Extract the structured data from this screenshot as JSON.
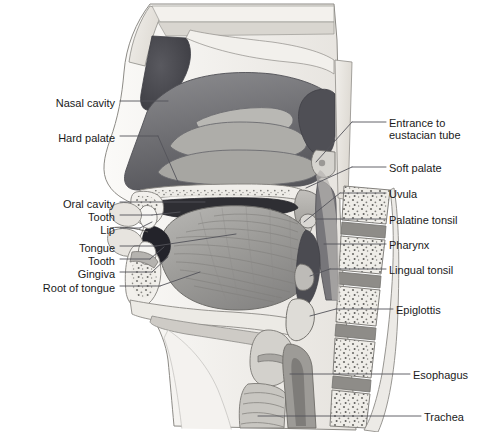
{
  "figure": {
    "type": "anatomical-illustration",
    "style": "grayscale medical illustration",
    "palette": {
      "background": "#ffffff",
      "bone": "#e8e6e1",
      "mucosa_dark": "#6e6e70",
      "cavity_dark": "#4a4a4e",
      "muscle_mid": "#9a9a9c",
      "cartilage_light": "#c9c8c4",
      "outline": "#5a5a5c",
      "leader_line": "#55555a",
      "text": "#1a1a1a"
    }
  },
  "labels_left": [
    {
      "id": "nasal-cavity",
      "text": "Nasal cavity",
      "text_x": 115,
      "text_y": 104,
      "line_to_x": 168,
      "line_to_y": 101
    },
    {
      "id": "hard-palate",
      "text": "Hard palate",
      "text_x": 115,
      "text_y": 139,
      "line_to_x": 176,
      "line_to_y": 178
    },
    {
      "id": "oral-cavity",
      "text": "Oral cavity",
      "text_x": 115,
      "text_y": 206,
      "line_to_x": 196,
      "line_to_y": 202
    },
    {
      "id": "tooth-upper",
      "text": "Tooth",
      "text_x": 115,
      "text_y": 219,
      "line_to_x": 178,
      "line_to_y": 215
    },
    {
      "id": "lip",
      "text": "Lip",
      "text_x": 115,
      "text_y": 232,
      "line_to_x": 163,
      "line_to_y": 226
    },
    {
      "id": "tongue",
      "text": "Tongue",
      "text_x": 115,
      "text_y": 250,
      "line_to_x": 214,
      "line_to_y": 235
    },
    {
      "id": "tooth-lower",
      "text": "Tooth",
      "text_x": 115,
      "text_y": 263,
      "line_to_x": 178,
      "line_to_y": 251
    },
    {
      "id": "gingiva",
      "text": "Gingiva",
      "text_x": 115,
      "text_y": 276,
      "line_to_x": 174,
      "line_to_y": 262
    },
    {
      "id": "root-of-tongue",
      "text": "Root of tongue",
      "text_x": 115,
      "text_y": 290,
      "line_to_x": 188,
      "line_to_y": 279
    }
  ],
  "labels_right": [
    {
      "id": "entrance-to-eustacian-tube",
      "line1": "Entrance to",
      "line2": "eustacian tube",
      "text_x": 389,
      "text_y": 125,
      "line_from_x": 312,
      "line_from_y": 160,
      "elbow_x": 372,
      "elbow_y": 126
    },
    {
      "id": "soft-palate",
      "line1": "Soft palate",
      "line2": "",
      "text_x": 389,
      "text_y": 170,
      "line_from_x": 312,
      "line_from_y": 185,
      "elbow_x": 372,
      "elbow_y": 170
    },
    {
      "id": "uvula",
      "line1": "Uvula",
      "line2": "",
      "text_x": 389,
      "text_y": 196,
      "line_from_x": 306,
      "line_from_y": 206,
      "elbow_x": 372,
      "elbow_y": 196
    },
    {
      "id": "palatine-tonsil",
      "line1": "Palatine tonsil",
      "line2": "",
      "text_x": 389,
      "text_y": 222,
      "line_from_x": 318,
      "line_from_y": 222,
      "elbow_x": 372,
      "elbow_y": 222
    },
    {
      "id": "pharynx",
      "line1": "Pharynx",
      "line2": "",
      "text_x": 389,
      "text_y": 247,
      "line_from_x": 322,
      "line_from_y": 247,
      "elbow_x": 372,
      "elbow_y": 247
    },
    {
      "id": "lingual-tonsil",
      "line1": "Lingual tonsil",
      "line2": "",
      "text_x": 389,
      "text_y": 272,
      "line_from_x": 318,
      "line_from_y": 275,
      "elbow_x": 372,
      "elbow_y": 272
    },
    {
      "id": "epiglottis",
      "line1": "Epiglottis",
      "line2": "",
      "text_x": 396,
      "text_y": 312,
      "line_from_x": 330,
      "line_from_y": 310,
      "elbow_x": 380,
      "elbow_y": 312
    },
    {
      "id": "esophagus",
      "line1": "Esophagus",
      "line2": "",
      "text_x": 413,
      "text_y": 377,
      "line_from_x": 288,
      "line_from_y": 371,
      "elbow_x": 397,
      "elbow_y": 377
    },
    {
      "id": "trachea",
      "line1": "Trachea",
      "line2": "",
      "text_x": 424,
      "text_y": 419,
      "line_from_x": 255,
      "line_from_y": 417,
      "elbow_x": 408,
      "elbow_y": 419
    }
  ]
}
